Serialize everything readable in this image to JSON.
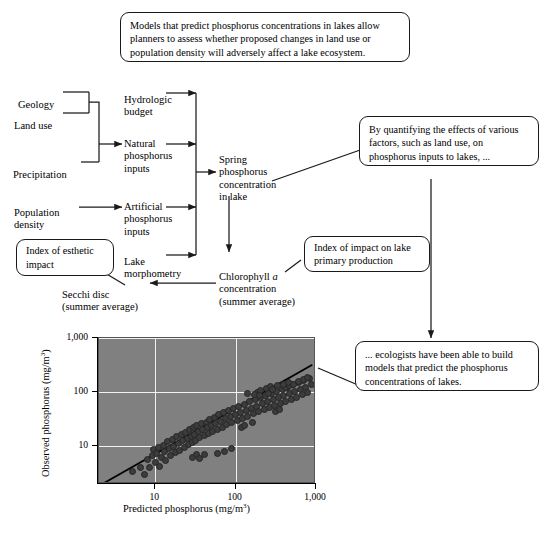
{
  "callouts": {
    "top": "Models that predict phosphorus concentrations in lakes allow planners to assess whether proposed changes in land use or population density will adversely affect a lake ecosystem.",
    "right_upper": "By quantifying the effects of various factors, such as land use, on phosphorus inputs to lakes, ...",
    "esthetic": "Index of esthetic impact",
    "primary_production": "Index of impact on lake primary production",
    "right_lower": "... ecologists have been able to build models that predict the phosphorus concentrations of lakes."
  },
  "flowchart": {
    "geology": "Geology",
    "land_use": "Land use",
    "precipitation": "Precipitation",
    "population_density": "Population\ndensity",
    "hydrologic_budget": "Hydrologic\nbudget",
    "natural_inputs": "Natural\nphosphorus\ninputs",
    "artificial_inputs": "Artificial\nphosphorus\ninputs",
    "lake_morphometry": "Lake\nmorphometry",
    "spring_phosphorus": "Spring\nphosphorus\nconcentration\nin lake",
    "chlorophyll_pre": "Chlorophyll ",
    "chlorophyll_ital": "a",
    "chlorophyll_post": "\nconcentration\n(summer average)",
    "secchi_disc": "Secchi disc\n(summer average)"
  },
  "chart_data": {
    "type": "scatter",
    "title": "",
    "xlabel_pre": "Predicted phosphorus (mg/m",
    "xlabel_sup": "3",
    "xlabel_post": ")",
    "ylabel_pre": "Observed phosphorus (mg/m",
    "ylabel_sup": "3",
    "ylabel_post": ")",
    "xscale": "log",
    "yscale": "log",
    "xlim": [
      2,
      1000
    ],
    "ylim": [
      2,
      1000
    ],
    "xticks": [
      10,
      100,
      1000
    ],
    "xticklabels": [
      "10",
      "100",
      "1,000"
    ],
    "yticks": [
      10,
      100,
      1000
    ],
    "yticklabels": [
      "10",
      "100",
      "1,000"
    ],
    "grid": true,
    "legend": "none",
    "plot_bgcolor": "#808080",
    "grid_color": "#f2f2f2",
    "point_color": "#3c3c3c",
    "line_color": "#000000",
    "fit_line": {
      "x": [
        2.2,
        900
      ],
      "y": [
        2.0,
        320
      ],
      "note": "1:1 regression trend"
    },
    "points": [
      [
        5.2,
        3.4
      ],
      [
        6.6,
        4.1
      ],
      [
        7.3,
        3.0
      ],
      [
        8.0,
        5.6
      ],
      [
        8.4,
        4.0
      ],
      [
        9.2,
        6.8
      ],
      [
        9.6,
        8.6
      ],
      [
        10.0,
        5.1
      ],
      [
        10.5,
        7.4
      ],
      [
        11.0,
        9.3
      ],
      [
        11.4,
        4.3
      ],
      [
        12.0,
        6.2
      ],
      [
        12.6,
        10.4
      ],
      [
        13.0,
        8.0
      ],
      [
        13.6,
        5.4
      ],
      [
        14.2,
        12.0
      ],
      [
        15.0,
        9.0
      ],
      [
        15.6,
        6.6
      ],
      [
        16.4,
        13.5
      ],
      [
        17.0,
        10.0
      ],
      [
        17.8,
        7.6
      ],
      [
        18.6,
        15.0
      ],
      [
        19.4,
        11.2
      ],
      [
        20.0,
        8.4
      ],
      [
        21.0,
        16.5
      ],
      [
        22.0,
        12.5
      ],
      [
        23.0,
        9.5
      ],
      [
        24.0,
        18.0
      ],
      [
        25.0,
        13.8
      ],
      [
        26.0,
        10.6
      ],
      [
        27.0,
        20.0
      ],
      [
        28.0,
        15.2
      ],
      [
        29.0,
        11.8
      ],
      [
        30.0,
        22.0
      ],
      [
        31.0,
        16.8
      ],
      [
        32.0,
        13.0
      ],
      [
        33.0,
        24.0
      ],
      [
        35.0,
        18.5
      ],
      [
        36.0,
        14.3
      ],
      [
        38.0,
        26.0
      ],
      [
        39.0,
        20.0
      ],
      [
        41.0,
        15.6
      ],
      [
        43.0,
        28.0
      ],
      [
        45.0,
        22.0
      ],
      [
        46.0,
        17.2
      ],
      [
        48.0,
        31.0
      ],
      [
        50.0,
        24.0
      ],
      [
        52.0,
        18.8
      ],
      [
        55.0,
        34.0
      ],
      [
        57.0,
        26.5
      ],
      [
        60.0,
        20.6
      ],
      [
        62.0,
        38.0
      ],
      [
        65.0,
        29.0
      ],
      [
        68.0,
        22.6
      ],
      [
        71.0,
        42.0
      ],
      [
        74.0,
        32.0
      ],
      [
        78.0,
        25.0
      ],
      [
        82.0,
        46.0
      ],
      [
        86.0,
        35.0
      ],
      [
        90.0,
        27.4
      ],
      [
        95.0,
        50.0
      ],
      [
        100.0,
        38.5
      ],
      [
        105.0,
        30.0
      ],
      [
        110.0,
        55.0
      ],
      [
        116.0,
        42.0
      ],
      [
        122.0,
        33.0
      ],
      [
        128.0,
        60.0
      ],
      [
        135.0,
        46.0
      ],
      [
        142.0,
        36.0
      ],
      [
        150.0,
        66.0
      ],
      [
        158.0,
        50.5
      ],
      [
        166.0,
        39.5
      ],
      [
        175.0,
        72.0
      ],
      [
        184.0,
        55.0
      ],
      [
        194.0,
        43.0
      ],
      [
        204.0,
        79.0
      ],
      [
        215.0,
        60.5
      ],
      [
        226.0,
        47.0
      ],
      [
        238.0,
        86.0
      ],
      [
        251.0,
        66.0
      ],
      [
        264.0,
        51.5
      ],
      [
        278.0,
        94.0
      ],
      [
        293.0,
        72.0
      ],
      [
        308.0,
        56.0
      ],
      [
        325.0,
        103.0
      ],
      [
        342.0,
        79.0
      ],
      [
        360.0,
        61.5
      ],
      [
        379.0,
        113.0
      ],
      [
        399.0,
        86.5
      ],
      [
        420.0,
        67.0
      ],
      [
        443.0,
        124.0
      ],
      [
        466.0,
        95.0
      ],
      [
        491.0,
        74.0
      ],
      [
        517.0,
        136.0
      ],
      [
        545.0,
        104.0
      ],
      [
        574.0,
        81.0
      ],
      [
        604.0,
        148.0
      ],
      [
        637.0,
        114.0
      ],
      [
        670.0,
        89.0
      ],
      [
        706.0,
        162.0
      ],
      [
        744.0,
        124.0
      ],
      [
        783.0,
        97.0
      ],
      [
        825.0,
        178.0
      ],
      [
        869.0,
        136.0
      ],
      [
        29.0,
        6.3
      ],
      [
        33.0,
        7.1
      ],
      [
        36.0,
        5.9
      ],
      [
        41.0,
        6.9
      ],
      [
        60.0,
        7.3
      ],
      [
        72.0,
        8.1
      ],
      [
        88.0,
        9.2
      ],
      [
        120.0,
        22.0
      ],
      [
        130.0,
        24.5
      ],
      [
        160.0,
        27.0
      ],
      [
        185.0,
        100.0
      ],
      [
        205.0,
        108.0
      ],
      [
        240.0,
        118.0
      ],
      [
        270.0,
        126.0
      ],
      [
        310.0,
        44.0
      ],
      [
        350.0,
        47.5
      ],
      [
        420.0,
        120.0
      ],
      [
        470.0,
        130.0
      ],
      [
        530.0,
        140.0
      ],
      [
        610.0,
        155.0
      ],
      [
        700.0,
        170.0
      ],
      [
        790.0,
        186.0
      ],
      [
        140.0,
        96.0
      ],
      [
        170.0,
        92.0
      ],
      [
        200.0,
        86.0
      ],
      [
        255.0,
        95.0
      ],
      [
        285.0,
        110.0
      ],
      [
        330.0,
        132.0
      ],
      [
        395.0,
        140.0
      ],
      [
        455.0,
        150.0
      ]
    ]
  }
}
